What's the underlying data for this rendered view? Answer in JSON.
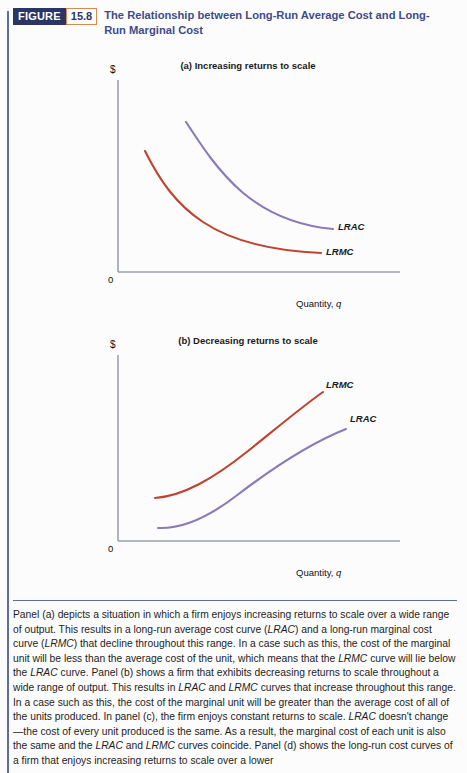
{
  "figure": {
    "tag": "FIGURE",
    "number": "15.8",
    "title": "The Relationship between Long-Run Average Cost and Long-Run Marginal Cost"
  },
  "colors": {
    "header_navy": "#2b3566",
    "title_blue": "#3d4c86",
    "number_border_orange": "#d98a4e",
    "rule_blue": "#5d6e9e",
    "lrac_purple": "#8a7ab9",
    "lrmc_red": "#bf4430",
    "axis_gray": "#9aa0ac"
  },
  "panels": [
    {
      "id": "a",
      "title": "(a) Increasing returns to scale",
      "y_axis_label": "$",
      "origin_label": "0",
      "x_axis_label_text": "Quantity, ",
      "x_axis_label_italic": "q",
      "curves": [
        {
          "name": "LRAC",
          "label": "LRAC",
          "color": "#8a7ab9"
        },
        {
          "name": "LRMC",
          "label": "LRMC",
          "color": "#bf4430"
        }
      ]
    },
    {
      "id": "b",
      "title": "(b) Decreasing returns to scale",
      "y_axis_label": "$",
      "origin_label": "0",
      "x_axis_label_text": "Quantity, ",
      "x_axis_label_italic": "q",
      "curves": [
        {
          "name": "LRMC",
          "label": "LRMC",
          "color": "#bf4430"
        },
        {
          "name": "LRAC",
          "label": "LRAC",
          "color": "#8a7ab9"
        }
      ]
    }
  ],
  "chart_data": [
    {
      "type": "line",
      "title": "(a) Increasing returns to scale",
      "xlabel": "Quantity, q",
      "ylabel": "$",
      "grid": false,
      "legend": "inline-right",
      "xlim": [
        0,
        100
      ],
      "ylim": [
        0,
        100
      ],
      "series": [
        {
          "name": "LRAC",
          "color": "#8a7ab9",
          "points": [
            [
              30,
              78
            ],
            [
              36,
              66
            ],
            [
              43,
              56
            ],
            [
              51,
              47
            ],
            [
              60,
              40
            ],
            [
              70,
              35
            ],
            [
              80,
              32
            ],
            [
              90,
              30
            ],
            [
              97,
              29
            ]
          ]
        },
        {
          "name": "LRMC",
          "color": "#bf4430",
          "points": [
            [
              12,
              55
            ],
            [
              18,
              46
            ],
            [
              25,
              38
            ],
            [
              34,
              31
            ],
            [
              44,
              25
            ],
            [
              56,
              21
            ],
            [
              68,
              19
            ],
            [
              80,
              18
            ],
            [
              90,
              17.5
            ]
          ]
        }
      ]
    },
    {
      "type": "line",
      "title": "(b) Decreasing returns to scale",
      "xlabel": "Quantity, q",
      "ylabel": "$",
      "grid": false,
      "legend": "inline-right",
      "xlim": [
        0,
        100
      ],
      "ylim": [
        0,
        100
      ],
      "series": [
        {
          "name": "LRMC",
          "color": "#bf4430",
          "points": [
            [
              17,
              25
            ],
            [
              25,
              26
            ],
            [
              34,
              31
            ],
            [
              44,
              40
            ],
            [
              54,
              52
            ],
            [
              64,
              65
            ],
            [
              72,
              76
            ],
            [
              78,
              84
            ]
          ]
        },
        {
          "name": "LRAC",
          "color": "#8a7ab9",
          "points": [
            [
              18,
              6
            ],
            [
              26,
              6
            ],
            [
              35,
              10
            ],
            [
              45,
              19
            ],
            [
              56,
              32
            ],
            [
              68,
              48
            ],
            [
              78,
              60
            ],
            [
              86,
              68
            ]
          ]
        }
      ]
    }
  ],
  "caption": {
    "paragraph": "Panel (a) depicts a situation in which a firm enjoys increasing returns to scale over a wide range of output. This results in a long-run average cost curve (LRAC) and a long-run marginal cost curve (LRMC) that decline throughout this range. In a case such as this, the cost of the marginal unit will be less than the average cost of the unit, which means that the LRMC curve will lie below the LRAC curve. Panel (b) shows a firm that exhibits decreasing returns to scale throughout a wide range of output. This results in LRAC and LRMC curves that increase throughout this range. In a case such as this, the cost of the marginal unit will be greater than the average cost of all of the units produced. In panel (c), the firm enjoys constant returns to scale. LRAC doesn't change—the cost of every unit produced is the same. As a result, the marginal cost of each unit is also the same and the LRAC and LRMC curves coincide. Panel (d) shows the long-run cost curves of a firm that enjoys increasing returns to scale over a lower"
  }
}
